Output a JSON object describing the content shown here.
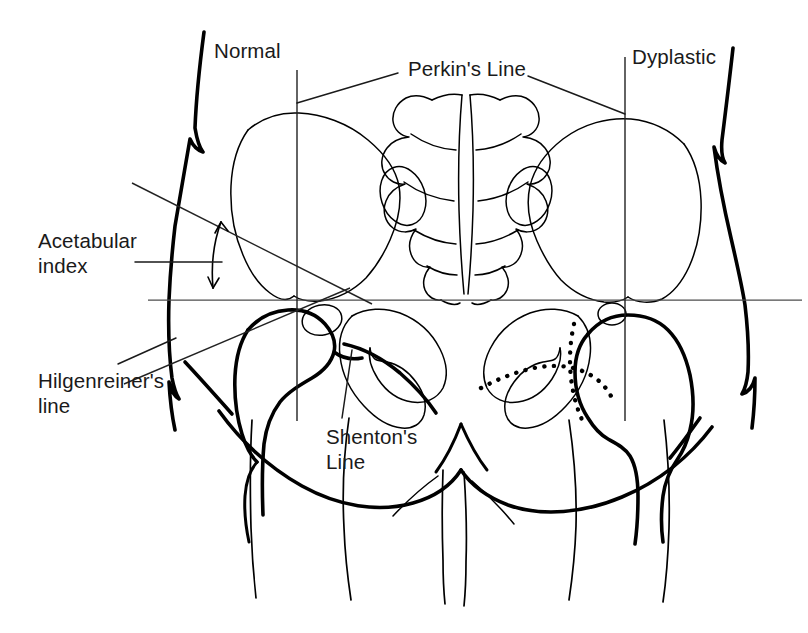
{
  "figure": {
    "kind": "medical-line-diagram",
    "background_color": "#ffffff",
    "ink_color": "#000000",
    "reference_line_color": "#4d4d4d",
    "width": 808,
    "height": 633
  },
  "labels": {
    "normal": "Normal",
    "perkins_line": "Perkin's Line",
    "dyplastic": "Dyplastic",
    "acetabular_index": "Acetabular\nindex",
    "hilgenreiners_line": "Hilgenreiner's\nline",
    "shentons_line": "Shenton's\nLine"
  },
  "annotations": {
    "sides": [
      {
        "side": "left-of-image",
        "label": "Normal",
        "shenton_line_style": "continuous"
      },
      {
        "side": "right-of-image",
        "label": "Dyplastic",
        "shenton_line_style": "broken-dotted"
      }
    ],
    "reference_lines": [
      {
        "name": "Hilgenreiner's line",
        "orientation": "horizontal",
        "style": "solid-thin",
        "y": 300
      },
      {
        "name": "Perkin's line (normal side)",
        "orientation": "vertical",
        "style": "solid-thin",
        "x": 297
      },
      {
        "name": "Perkin's line (dyplastic side)",
        "orientation": "vertical",
        "style": "solid-thin",
        "x": 625
      },
      {
        "name": "Acetabular roof line",
        "orientation": "oblique",
        "style": "solid-thin"
      },
      {
        "name": "Acetabular index angle marker",
        "orientation": "curved-arrow",
        "style": "double-headed-arc"
      }
    ],
    "anatomy": [
      "torso skin outline",
      "iliac wing (left)",
      "iliac wing (right)",
      "sacrum with transverse ridges and sacral foramina",
      "sacroiliac joints",
      "obturator foramen (left)",
      "obturator foramen (right)",
      "pubic symphysis",
      "proximal femur / femoral head (normal side)",
      "proximal femur / femoral head (dyplastic, laterally displaced)",
      "gluteal crease",
      "thigh outlines"
    ]
  }
}
